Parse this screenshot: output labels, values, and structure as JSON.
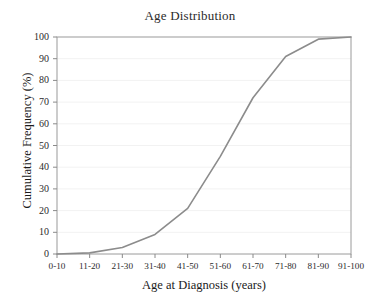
{
  "chart_data": {
    "type": "line",
    "title": "Age Distribution",
    "xlabel": "Age at Diagnosis (years)",
    "ylabel": "Cumulative Frequency (%)",
    "categories": [
      "0-10",
      "11-20",
      "21-30",
      "31-40",
      "41-50",
      "51-60",
      "61-70",
      "71-80",
      "81-90",
      "91-100"
    ],
    "values": [
      0,
      0.5,
      3,
      9,
      21,
      45,
      72,
      91,
      99,
      100
    ],
    "series": [
      {
        "name": "Cumulative Frequency",
        "values": [
          0,
          0.5,
          3,
          9,
          21,
          45,
          72,
          91,
          99,
          100
        ],
        "color": "#8c8c8c"
      }
    ],
    "ylim": [
      0,
      100
    ],
    "ytick_labels": [
      "0",
      "10",
      "20",
      "30",
      "40",
      "50",
      "60",
      "70",
      "80",
      "90",
      "100"
    ],
    "ytick_values": [
      0,
      10,
      20,
      30,
      40,
      50,
      60,
      70,
      80,
      90,
      100
    ],
    "grid": true,
    "grid_axis": "y",
    "legend": "none",
    "line_color": "#8c8c8c",
    "axis_color": "#8a8a8a",
    "grid_color": "#f2f2f2",
    "background_color": "#ffffff",
    "markers": false
  }
}
